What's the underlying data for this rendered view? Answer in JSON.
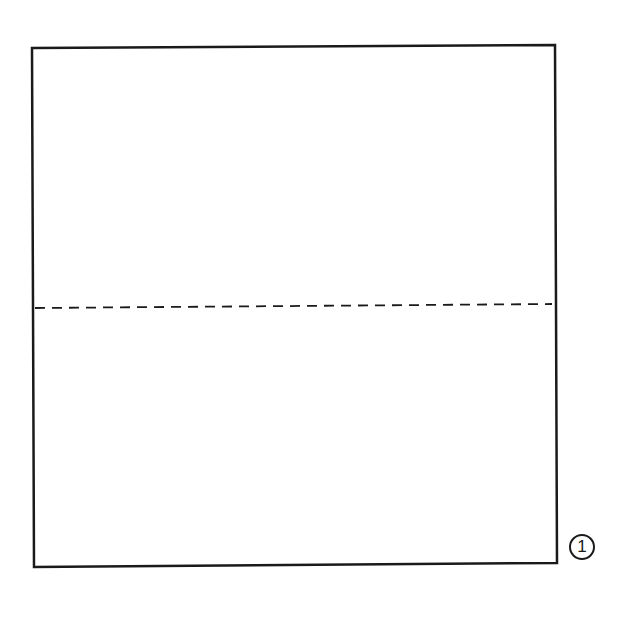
{
  "diagram": {
    "step_number": "1",
    "square": {
      "corners": {
        "top_left": [
          32,
          48
        ],
        "top_right": [
          555,
          45
        ],
        "bottom_right": [
          557,
          563
        ],
        "bottom_left": [
          34,
          567
        ]
      },
      "stroke_color": "#1a1a1a",
      "stroke_width": 2.5
    },
    "fold_line": {
      "type": "valley-fold-dashed",
      "start": [
        35,
        308
      ],
      "end": [
        552,
        304
      ],
      "dash": "10 7",
      "color": "#1a1a1a"
    }
  }
}
